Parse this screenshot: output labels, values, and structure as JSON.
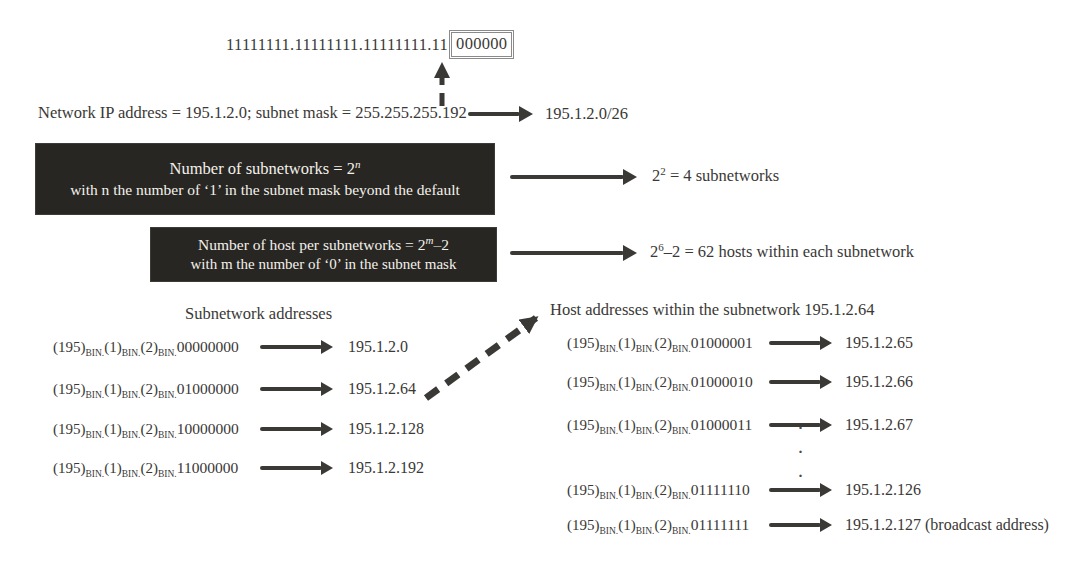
{
  "figure": {
    "binary_mask": {
      "prefix": "11111111.11111111.11111111.11",
      "boxed": "000000"
    },
    "network_line": {
      "text": "Network IP address = 195.1.2.0; subnet mask = 255.255.255.192",
      "result": "195.1.2.0/26"
    },
    "subnet_rule": {
      "line1_base": "Number of subnetworks = 2",
      "line1_sup": "n",
      "line2": "with n the number of ‘1’ in the subnet mask beyond the default",
      "result_base": "2",
      "result_sup": "2",
      "result_rest": " = 4 subnetworks"
    },
    "host_rule": {
      "line1_base": "Number of host per subnetworks = 2",
      "line1_sup": "m",
      "line1_rest": "–2",
      "line2": "with m the number of ‘0’ in the subnet mask",
      "result_base": "2",
      "result_sup": "6",
      "result_rest": "–2 = 62 hosts within each subnetwork"
    },
    "bin_prefix": {
      "o1": "(195)",
      "o2": "(1)",
      "o3": "(2)",
      "sub": "BIN."
    },
    "subnetworks": {
      "title": "Subnetwork addresses",
      "rows": [
        {
          "bits": "00000000",
          "address": "195.1.2.0"
        },
        {
          "bits": "01000000",
          "address": "195.1.2.64"
        },
        {
          "bits": "10000000",
          "address": "195.1.2.128"
        },
        {
          "bits": "11000000",
          "address": "195.1.2.192"
        }
      ]
    },
    "hosts": {
      "title": "Host addresses within the subnetwork 195.1.2.64",
      "rows": [
        {
          "bits": "01000001",
          "address": "195.1.2.65"
        },
        {
          "bits": "01000010",
          "address": "195.1.2.66"
        },
        {
          "bits": "01000011",
          "address": "195.1.2.67"
        },
        {
          "bits": "01111110",
          "address": "195.1.2.126"
        },
        {
          "bits": "01111111",
          "address": "195.1.2.127 (broadcast address)"
        }
      ],
      "dot": "·"
    },
    "colors": {
      "ink": "#3a3936",
      "rule_box_bg": "#272623",
      "rule_box_text": "#f4f1ea"
    }
  }
}
